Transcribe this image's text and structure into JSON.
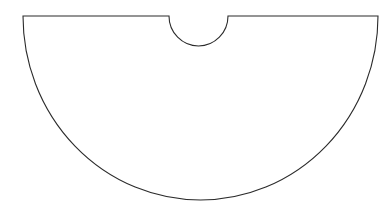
{
  "document": {
    "title": "Geometric Shape Drawing",
    "background_color": "#ffffff",
    "canvas": {
      "width": 389,
      "height": 213
    }
  },
  "figure": {
    "name": "cone-net-sector-with-semicircular-notch",
    "description": "Outline line drawing of a half-disc (semicircular sector) whose straight top edge has a small semicircular notch cut out of its middle.",
    "stroke_color": "#2b2b2b",
    "fill_color": "#ffffff",
    "stroke_width": 1.1,
    "geometry": {
      "top_edge": {
        "y": 16,
        "x_start": 23,
        "x_end": 378,
        "notch_gap_start": 169,
        "notch_gap_end": 228
      },
      "notch": {
        "shape": "semicircle",
        "center_x": 198.5,
        "center_y": 16,
        "radius": 29.5,
        "bottom_y": 46,
        "direction": "downward"
      },
      "main_arc": {
        "shape": "circular-arc",
        "center_x": 200.5,
        "center_y": 16,
        "radius_x": 177.5,
        "radius_y": 184,
        "start_point": [
          23,
          16
        ],
        "end_point": [
          378,
          16
        ],
        "bottom_point": [
          200.5,
          200
        ],
        "sweep": "clockwise-downward"
      }
    },
    "path_d": "M 23 16 L 169 16 A 29.5 30 0 0 0 228 16 L 378 16 A 177.5 184 0 0 1 23 16 Z"
  }
}
